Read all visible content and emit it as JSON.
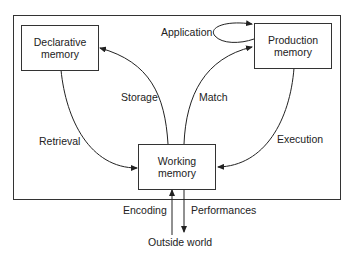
{
  "diagram": {
    "nodes": {
      "declarative": {
        "line1": "Declarative",
        "line2": "memory"
      },
      "production": {
        "line1": "Production",
        "line2": "memory"
      },
      "working": {
        "line1": "Working",
        "line2": "memory"
      },
      "outside": {
        "label": "Outside world"
      }
    },
    "edges": {
      "application": "Application",
      "storage": "Storage",
      "match": "Match",
      "retrieval": "Retrieval",
      "execution": "Execution",
      "encoding": "Encoding",
      "performances": "Performances"
    },
    "colors": {
      "stroke": "#333333",
      "text": "#222222",
      "background": "#ffffff"
    }
  }
}
